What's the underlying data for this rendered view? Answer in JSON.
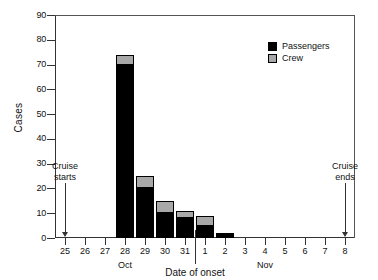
{
  "chart_data": {
    "type": "bar",
    "title": "",
    "subtitle": "",
    "xlabel": "Date of onset",
    "ylabel": "Cases",
    "ylim": [
      0,
      90
    ],
    "ytick_step": 10,
    "yticks": [
      "0",
      "10",
      "20",
      "30",
      "40",
      "50",
      "60",
      "70",
      "80",
      "90"
    ],
    "grid": false,
    "stacked": true,
    "legend_position": "top-right",
    "categories": [
      "25",
      "26",
      "27",
      "28",
      "29",
      "30",
      "31",
      "1",
      "2",
      "3",
      "4",
      "5",
      "6",
      "7",
      "8"
    ],
    "category_months": [
      "Oct",
      "Oct",
      "Oct",
      "Oct",
      "Oct",
      "Oct",
      "Oct",
      "Nov",
      "Nov",
      "Nov",
      "Nov",
      "Nov",
      "Nov",
      "Nov",
      "Nov"
    ],
    "month_labels": [
      {
        "label": "Oct",
        "at_category": "28"
      },
      {
        "label": "Nov",
        "at_category": "4"
      }
    ],
    "series": [
      {
        "name": "Passengers",
        "color": "#000000",
        "values": [
          0,
          0,
          0,
          70,
          20,
          10,
          8,
          5,
          2,
          0,
          0,
          0,
          0,
          0,
          0
        ]
      },
      {
        "name": "Crew",
        "color": "#a8a8a8",
        "values": [
          0,
          0,
          0,
          4,
          5,
          5,
          3,
          4,
          0,
          0,
          0,
          0,
          0,
          0,
          0
        ]
      }
    ],
    "totals": [
      0,
      0,
      0,
      74,
      25,
      15,
      11,
      9,
      2,
      0,
      0,
      0,
      0,
      0,
      0
    ],
    "annotations": [
      {
        "text": "Cruise\nstarts",
        "at_category": "25",
        "value_top": 22
      },
      {
        "text": "Cruise\nends",
        "at_category": "8",
        "value_top": 22
      }
    ]
  },
  "legend": {
    "items": [
      {
        "label": "Passengers",
        "color": "#000000"
      },
      {
        "label": "Crew",
        "color": "#a8a8a8"
      }
    ]
  },
  "axes": {
    "y_title": "Cases",
    "x_title": "Date of onset"
  }
}
